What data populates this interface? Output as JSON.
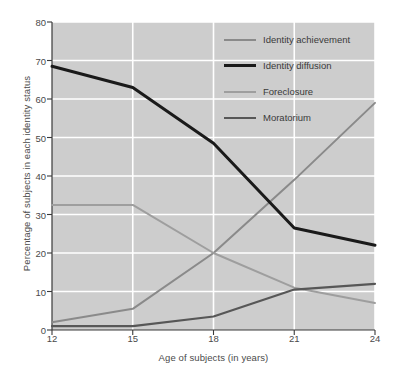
{
  "chart_data": {
    "type": "line",
    "title": "",
    "xlabel": "Age of subjects (in years)",
    "ylabel": "Percentage of subjects in each identity status",
    "x": [
      12,
      15,
      18,
      21,
      24
    ],
    "xticklabels": [
      "12",
      "15",
      "18",
      "21",
      "24"
    ],
    "yticklabels": [
      "0",
      "10",
      "20",
      "30",
      "40",
      "50",
      "60",
      "70",
      "80"
    ],
    "xlim": [
      12,
      24
    ],
    "ylim": [
      0,
      80
    ],
    "grid": true,
    "legend_position": "top-right",
    "plot_background": "#cdcdcd",
    "gridline_color": "#ffffff",
    "series": [
      {
        "name": "Identity achievement",
        "color": "#8a8a8a",
        "width": 2.0,
        "values": [
          2,
          5.5,
          20,
          39,
          59
        ]
      },
      {
        "name": "Identity diffusion",
        "color": "#1a1a1a",
        "width": 3.0,
        "values": [
          68.5,
          63,
          48.5,
          26.5,
          22
        ]
      },
      {
        "name": "Foreclosure",
        "color": "#9e9e9e",
        "width": 2.0,
        "values": [
          32.5,
          32.5,
          20,
          11,
          7
        ]
      },
      {
        "name": "Moratorium",
        "color": "#575757",
        "width": 2.2,
        "values": [
          1,
          1,
          3.5,
          10.5,
          12
        ]
      }
    ]
  },
  "axes": {
    "yticks": [
      {
        "label": "80"
      },
      {
        "label": "70"
      },
      {
        "label": "60"
      },
      {
        "label": "50"
      },
      {
        "label": "40"
      },
      {
        "label": "30"
      },
      {
        "label": "20"
      },
      {
        "label": "10"
      },
      {
        "label": "0"
      }
    ],
    "xticks": [
      {
        "label": "12"
      },
      {
        "label": "15"
      },
      {
        "label": "18"
      },
      {
        "label": "21"
      },
      {
        "label": "24"
      }
    ],
    "ylabel": "Percentage of subjects in each identity status",
    "xlabel": "Age of subjects (in years)"
  },
  "legend": {
    "items": [
      {
        "label": "Identity achievement"
      },
      {
        "label": "Identity diffusion"
      },
      {
        "label": "Foreclosure"
      },
      {
        "label": "Moratorium"
      }
    ]
  }
}
